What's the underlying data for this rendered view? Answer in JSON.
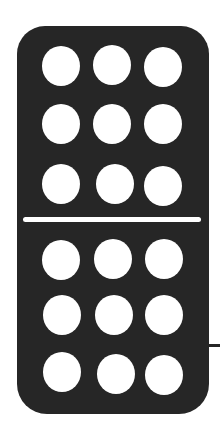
{
  "domino": {
    "top_value": 9,
    "bottom_value": 9,
    "colors": {
      "tile": "#262626",
      "pip": "#ffffff",
      "divider": "#ffffff",
      "background": "#ffffff"
    }
  }
}
